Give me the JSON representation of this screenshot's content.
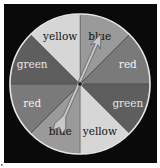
{
  "figure": {
    "background_color": "#0a0a0a",
    "rim_color": "#e8e8e8",
    "center": {
      "x": 80,
      "y": 84
    },
    "radius": 70,
    "sectors": [
      {
        "label": "blue",
        "start_deg": 0,
        "end_deg": 45,
        "fill": "#9a9a9a",
        "text_color": "#111111"
      },
      {
        "label": "red",
        "start_deg": 45,
        "end_deg": 90,
        "fill": "#7a7a7a",
        "text_color": "#f2f2f2"
      },
      {
        "label": "green",
        "start_deg": 90,
        "end_deg": 135,
        "fill": "#5e5e5e",
        "text_color": "#e6e6e6"
      },
      {
        "label": "yellow",
        "start_deg": 135,
        "end_deg": 180,
        "fill": "#d6d6d6",
        "text_color": "#111111"
      },
      {
        "label": "blue",
        "start_deg": 180,
        "end_deg": 225,
        "fill": "#9a9a9a",
        "text_color": "#111111"
      },
      {
        "label": "red",
        "start_deg": 225,
        "end_deg": 270,
        "fill": "#7a7a7a",
        "text_color": "#f2f2f2"
      },
      {
        "label": "green",
        "start_deg": 270,
        "end_deg": 315,
        "fill": "#5e5e5e",
        "text_color": "#e6e6e6"
      },
      {
        "label": "yellow",
        "start_deg": 315,
        "end_deg": 360,
        "fill": "#d6d6d6",
        "text_color": "#111111"
      }
    ],
    "pointer": {
      "type": "arrow",
      "pointing_to": "blue",
      "head": {
        "x": 101,
        "y": 34
      },
      "tail": {
        "x": 58,
        "y": 131
      },
      "fill": "#c8c8c8",
      "stroke": "#555555"
    }
  }
}
